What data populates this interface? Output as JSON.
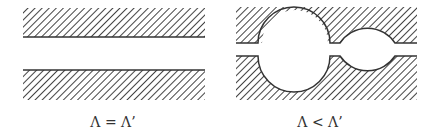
{
  "diagram": {
    "panels": [
      {
        "id": "equal",
        "caption": "Λ = Λ’",
        "description": "Two parallel hatched walls with uniform straight channel"
      },
      {
        "id": "less",
        "caption": "Λ < Λ’",
        "description": "Two hatched walls with two circular cavities forming wider channel"
      }
    ],
    "colors": {
      "stroke": "#333333",
      "hatch": "#444444",
      "background": "#ffffff"
    }
  }
}
